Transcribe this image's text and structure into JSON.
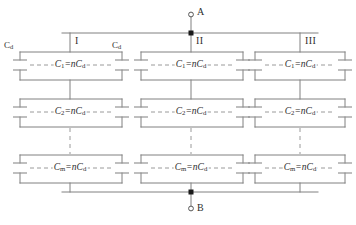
{
  "diagram": {
    "terminals": [
      {
        "id": "A",
        "label": "A",
        "position": "top",
        "marker": "open-circle"
      },
      {
        "id": "B",
        "label": "B",
        "position": "bottom",
        "marker": "open-circle"
      }
    ],
    "columns": [
      {
        "id": "I",
        "label": "I"
      },
      {
        "id": "II",
        "label": "II"
      },
      {
        "id": "III",
        "label": "III"
      }
    ],
    "rows": [
      {
        "id": "row1",
        "name": "C1",
        "symbol": "C",
        "index": "1",
        "equation_rhs": "nC",
        "rhs_sub": "d"
      },
      {
        "id": "row2",
        "name": "C2",
        "symbol": "C",
        "index": "2",
        "equation_rhs": "nC",
        "rhs_sub": "d"
      },
      {
        "id": "row3",
        "name": "Cm",
        "symbol": "C",
        "index": "m",
        "equation_rhs": "nC",
        "rhs_sub": "d"
      }
    ],
    "unit_capacitor": {
      "symbol": "C",
      "sub": "d",
      "label": "Cd"
    },
    "unit_labels": [
      {
        "id": "cd-left",
        "text_symbol": "C",
        "text_sub": "d"
      },
      {
        "id": "cd-right",
        "text_symbol": "C",
        "text_sub": "d"
      }
    ],
    "equations": [
      "C1=nCd",
      "C2=nCd",
      "Cm=nCd"
    ],
    "colors": {
      "wire": "#808080",
      "plate": "#8a8a8a",
      "text": "#2e2e2e",
      "node": "#1a1a1a",
      "dashed": "#9a9a9a",
      "background": "#ffffff"
    },
    "continuation": {
      "style": "vertical-dashed",
      "meaning": "rows continue between C2 and Cm"
    }
  }
}
